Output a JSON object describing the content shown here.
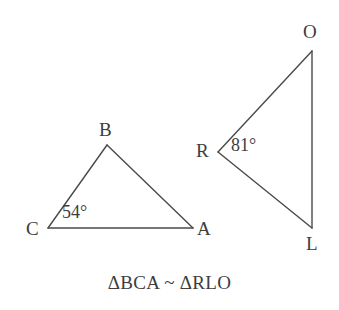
{
  "figure": {
    "type": "geometry-diagram",
    "background_color": "#ffffff",
    "stroke_color": "#4a4a4a",
    "text_color": "#3d3d3d",
    "width": 339,
    "height": 310
  },
  "triangles": [
    {
      "id": "left",
      "name": "triangle-BCA",
      "vertices": [
        {
          "label": "B",
          "x": 107,
          "y": 145,
          "label_x": 99,
          "label_y": 120
        },
        {
          "label": "C",
          "x": 48,
          "y": 228,
          "label_x": 26,
          "label_y": 219
        },
        {
          "label": "A",
          "x": 193,
          "y": 228,
          "label_x": 197,
          "label_y": 219
        }
      ],
      "edges": [
        {
          "from": "C",
          "to": "B"
        },
        {
          "from": "B",
          "to": "A"
        },
        {
          "from": "A",
          "to": "C"
        }
      ],
      "angles": [
        {
          "at": "C",
          "value": "54°",
          "label_x": 62,
          "label_y": 203
        }
      ]
    },
    {
      "id": "right",
      "name": "triangle-RLO",
      "vertices": [
        {
          "label": "O",
          "x": 312,
          "y": 51,
          "label_x": 303,
          "label_y": 22
        },
        {
          "label": "R",
          "x": 218,
          "y": 152,
          "label_x": 196,
          "label_y": 141
        },
        {
          "label": "L",
          "x": 312,
          "y": 228,
          "label_x": 306,
          "label_y": 234
        }
      ],
      "edges": [
        {
          "from": "R",
          "to": "O"
        },
        {
          "from": "O",
          "to": "L"
        },
        {
          "from": "L",
          "to": "R"
        }
      ],
      "angles": [
        {
          "at": "R",
          "value": "81°",
          "label_x": 231,
          "label_y": 136
        }
      ]
    }
  ],
  "caption": {
    "text": "ΔBCA ~ ΔRLO",
    "left_triangle": "ΔBCA",
    "relation": "~",
    "right_triangle": "ΔRLO"
  }
}
